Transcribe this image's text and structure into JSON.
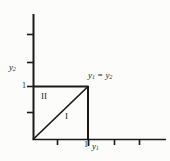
{
  "figure": {
    "background_color": "#fcfcfa",
    "line_color": "#1a1a1a"
  },
  "axes": {
    "vertical": {
      "name": "y2",
      "label_html": "y",
      "label_sub": "2",
      "origin": [
        33,
        139
      ],
      "end": [
        33,
        14
      ],
      "ticks": [
        {
          "value": "",
          "y": 34
        },
        {
          "value": "",
          "y": 62
        },
        {
          "value": "1",
          "y": 86
        }
      ]
    },
    "horizontal": {
      "name": "y1",
      "label_html": "y",
      "label_sub": "1",
      "origin": [
        33,
        139
      ],
      "end": [
        166,
        139
      ],
      "ticks": [
        {
          "value": "",
          "x": 57
        },
        {
          "value": "1",
          "x": 88
        },
        {
          "value": "",
          "x": 114
        },
        {
          "value": "",
          "x": 139
        }
      ]
    }
  },
  "labels": {
    "y_axis_name": "y",
    "y_axis_sub": "2",
    "x_axis_name": "y",
    "x_axis_sub": "1",
    "y_tick_one": "1",
    "x_tick_one": "1",
    "region_one": "I",
    "region_two": "II",
    "diagonal_lhs": "y",
    "diagonal_lhs_sub": "1",
    "diagonal_eq": " = ",
    "diagonal_rhs": "y",
    "diagonal_rhs_sub": "2"
  },
  "shapes": {
    "unit_square": {
      "x0": 33,
      "y0": 86,
      "x1": 88,
      "y1": 139
    },
    "diagonal": {
      "from": [
        33,
        139
      ],
      "to": [
        88,
        86
      ]
    }
  }
}
